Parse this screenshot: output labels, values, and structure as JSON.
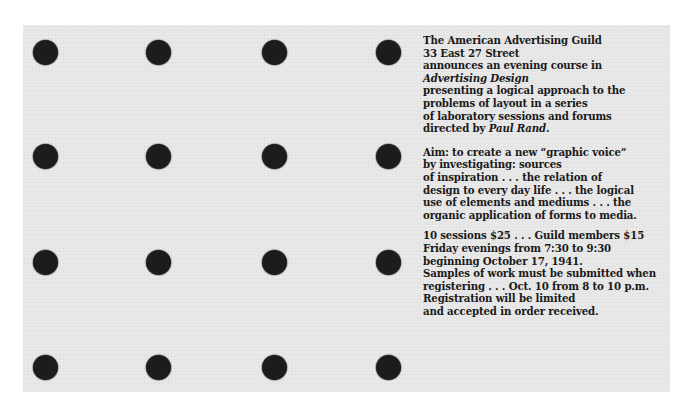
{
  "document": {
    "type": "announcement-card",
    "colors": {
      "background": "#e7e7e7",
      "dots": "#1c1c1c",
      "text": "#1a1a1a"
    },
    "dot_grid": {
      "rows": 4,
      "columns": 4
    },
    "paragraphs": [
      {
        "lines": [
          "The American Advertising Guild",
          "33 East 27 Street",
          "announces an evening course in",
          "Advertising Design",
          "presenting a logical approach to the",
          "problems of layout in a series",
          "of laboratory sessions and forums",
          "directed by "
        ],
        "italic_line": "Advertising Design",
        "director_name": "Paul Rand",
        "director_suffix": "."
      },
      {
        "lines": [
          "Aim: to create a new “graphic voice”",
          "by investigating: sources",
          "of inspiration . . . the relation of",
          "design to every day life . . . the logical",
          "use of elements and mediums . . . the",
          "organic application of forms to media."
        ]
      },
      {
        "lines": [
          "10 sessions $25 . . . Guild members $15",
          "Friday evenings from 7:30 to 9:30",
          "beginning October 17, 1941.",
          "Samples of work must be submitted when",
          "registering . . . Oct. 10 from 8 to 10 p.m.",
          "Registration will be limited",
          "and accepted in order received."
        ]
      }
    ]
  }
}
